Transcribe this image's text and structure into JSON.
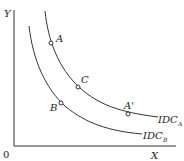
{
  "diagram": {
    "axes": {
      "y_label": "Y",
      "x_label": "X",
      "origin_label": "0"
    },
    "curves": [
      {
        "name": "IDC_A",
        "label_main": "IDC",
        "label_sub": "A"
      },
      {
        "name": "IDC_B",
        "label_main": "IDC",
        "label_sub": "B"
      }
    ],
    "points": [
      {
        "label": "A",
        "curve": "IDC_A"
      },
      {
        "label": "C",
        "curve": "IDC_A"
      },
      {
        "label": "A'",
        "curve": "IDC_A"
      },
      {
        "label": "B",
        "curve": "IDC_B"
      }
    ],
    "colors": {
      "line": "#333333",
      "background": "#ffffff"
    }
  }
}
